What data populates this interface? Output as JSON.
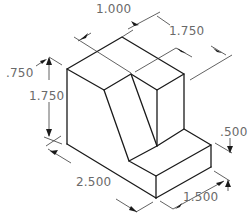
{
  "drawing": {
    "title": "Isometric view of stepped block with slanted face",
    "line_color": "#1a1a1a",
    "dimension_text_color": "#6a6a6a",
    "dimensions": [
      {
        "id": "top-depth",
        "label": "1.000"
      },
      {
        "id": "top-width",
        "label": "1.750"
      },
      {
        "id": "slant-offset",
        "label": ".750"
      },
      {
        "id": "height",
        "label": "1.750"
      },
      {
        "id": "step-height",
        "label": ".500"
      },
      {
        "id": "length",
        "label": "2.500"
      },
      {
        "id": "step-width",
        "label": "1.500"
      }
    ]
  }
}
